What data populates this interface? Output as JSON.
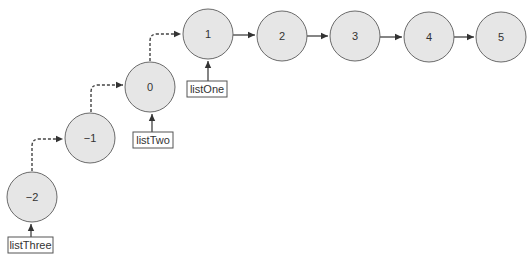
{
  "diagram": {
    "colors": {
      "node_fill": "#e6e6e6",
      "node_stroke": "#6a6a6a",
      "arrow": "#333333",
      "label_border": "#555555"
    },
    "nodes": [
      {
        "id": "n-2",
        "value": "−2",
        "cx": 32,
        "cy": 197
      },
      {
        "id": "n-1",
        "value": "−1",
        "cx": 90,
        "cy": 138
      },
      {
        "id": "n0",
        "value": "0",
        "cx": 150,
        "cy": 87
      },
      {
        "id": "n1",
        "value": "1",
        "cx": 208,
        "cy": 34
      },
      {
        "id": "n2",
        "value": "2",
        "cx": 282,
        "cy": 36
      },
      {
        "id": "n3",
        "value": "3",
        "cx": 355,
        "cy": 36
      },
      {
        "id": "n4",
        "value": "4",
        "cx": 429,
        "cy": 37
      },
      {
        "id": "n5",
        "value": "5",
        "cx": 501,
        "cy": 37
      }
    ],
    "solid_links": [
      {
        "from": "1",
        "to": "2"
      },
      {
        "from": "2",
        "to": "3"
      },
      {
        "from": "3",
        "to": "4"
      },
      {
        "from": "4",
        "to": "5"
      }
    ],
    "dashed_links": [
      {
        "from": "−2",
        "to": "−1"
      },
      {
        "from": "−1",
        "to": "0"
      },
      {
        "from": "0",
        "to": "1"
      }
    ],
    "pointers": [
      {
        "label": "listOne",
        "points_to": "1"
      },
      {
        "label": "listTwo",
        "points_to": "0"
      },
      {
        "label": "listThree",
        "points_to": "−2"
      }
    ]
  }
}
